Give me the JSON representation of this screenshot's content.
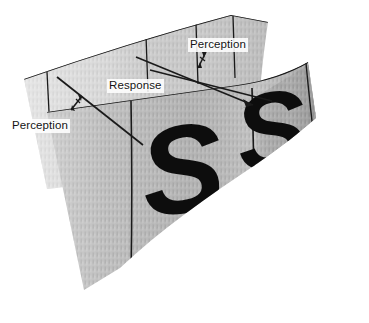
{
  "figure": {
    "background_color": "#ffffff"
  },
  "labels": {
    "perception_left": "Perception",
    "response": "Response",
    "perception_right": "Perception"
  },
  "glyphs": {
    "stimulus": "S",
    "stimulus_prime": "S′"
  },
  "colors": {
    "line": "#1a1a1a",
    "text": "#141414",
    "panel_front": "#b9b9b9",
    "panel_back": "#cdcdcd",
    "panel_right": "#b3b3b3",
    "glyph": "#0d0d0d",
    "background": "#ffffff"
  },
  "icons": {
    "arrow_double_left": "double-headed-arrow",
    "arrow_double_right": "double-headed-arrow",
    "arrow_head_response": "arrowhead"
  }
}
